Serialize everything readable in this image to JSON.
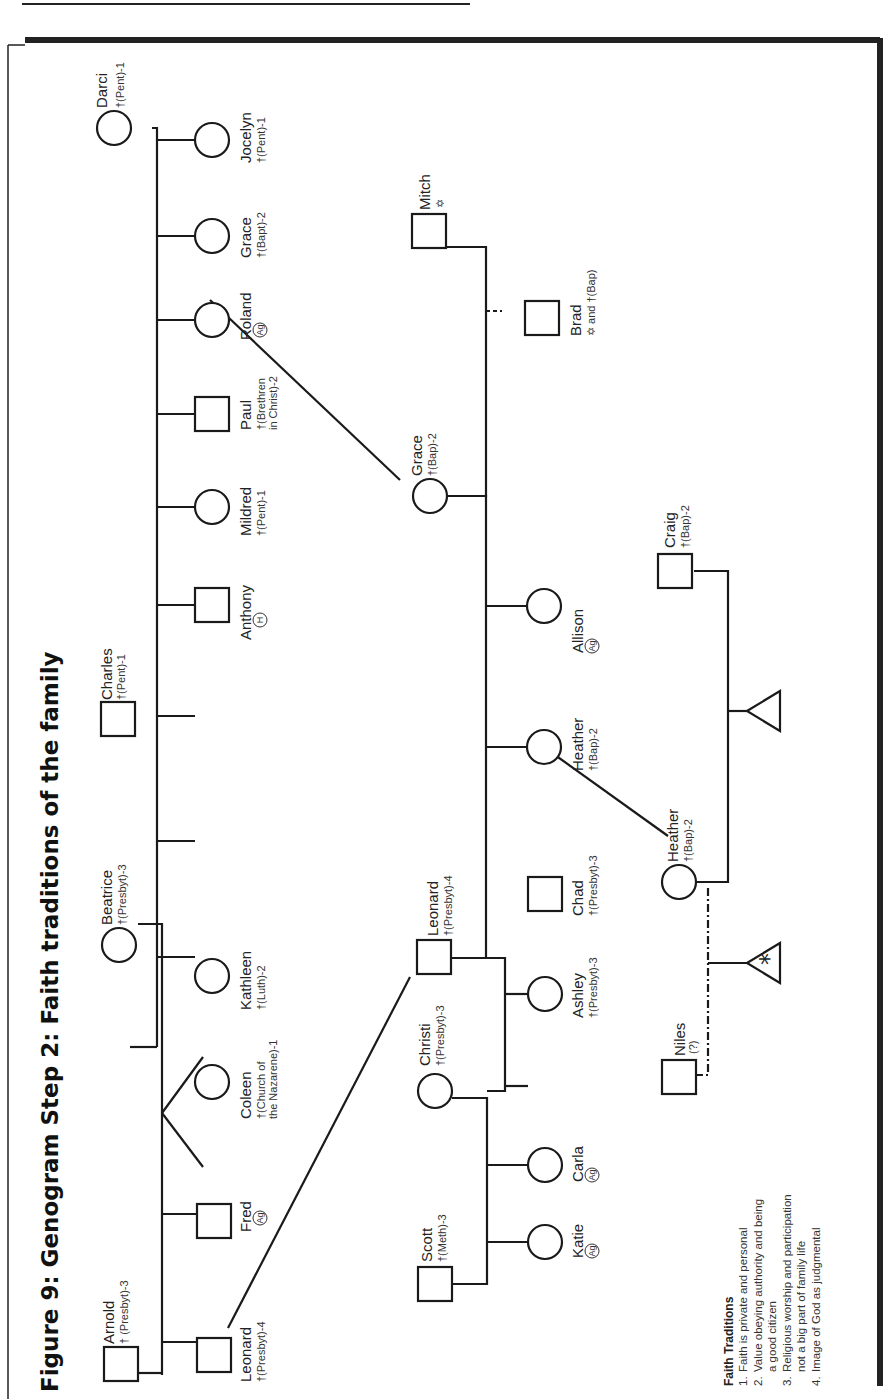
{
  "figure": {
    "title": "Figure 9: Genogram Step 2: Faith traditions of the family"
  },
  "people": {
    "darci": {
      "name": "Darci",
      "faith": "†(Pent)-1"
    },
    "jocelyn": {
      "name": "Jocelyn",
      "faith": "†(Pent)-1"
    },
    "grace_child": {
      "name": "Grace",
      "faith": "†(Bapt)-2"
    },
    "roland": {
      "name": "Roland",
      "badge": "Ag"
    },
    "paul": {
      "name": "Paul",
      "faith_line1": "†(Brethren",
      "faith_line2": "in Christ)-2"
    },
    "mildred": {
      "name": "Mildred",
      "faith": "†(Pent)-1"
    },
    "anthony": {
      "name": "Anthony",
      "badge": "H"
    },
    "charles": {
      "name": "Charles",
      "faith": "†(Pent)-1"
    },
    "beatrice": {
      "name": "Beatrice",
      "faith": "†(Presbyt)-3"
    },
    "kathleen": {
      "name": "Kathleen",
      "faith": "†(Luth)-2"
    },
    "coleen": {
      "name": "Coleen",
      "faith_line1": "†(Church of",
      "faith_line2": "the Nazarene)-1"
    },
    "fred": {
      "name": "Fred",
      "badge": "Ag"
    },
    "arnold": {
      "name": "Arnold",
      "faith": "† (Presbyt)-3"
    },
    "leonard_child": {
      "name": "Leonard",
      "faith": "†(Presbyt)-4"
    },
    "mitch": {
      "name": "Mitch",
      "symbol": "✡"
    },
    "brad": {
      "name": "Brad",
      "faith": "✡ and †(Bap)"
    },
    "grace_parent": {
      "name": "Grace",
      "faith": "†(Bap)-2"
    },
    "allison": {
      "name": "Allison",
      "badge": "Ag"
    },
    "heather_child": {
      "name": "Heather",
      "faith": "†(Bap)-2"
    },
    "leonard_parent": {
      "name": "Leonard",
      "faith": "†(Presbyt)-4"
    },
    "chad": {
      "name": "Chad",
      "faith": "†(Presbyt)-3"
    },
    "ashley": {
      "name": "Ashley",
      "faith": "†(Presbyt)-3"
    },
    "christi": {
      "name": "Christi",
      "faith": "†(Presbyt)-3"
    },
    "carla": {
      "name": "Carla",
      "badge": "Ag"
    },
    "scott": {
      "name": "Scott",
      "faith": "†(Meth)-3"
    },
    "katie": {
      "name": "Katie",
      "badge": "Ag"
    },
    "craig": {
      "name": "Craig",
      "faith": "†(Bap)-2"
    },
    "heather_parent": {
      "name": "Heather",
      "faith": "†(Bap)-2"
    },
    "niles": {
      "name": "Niles",
      "faith": "(?)"
    },
    "pregnancy_asterisk": {
      "symbol": "*"
    }
  },
  "legend": {
    "heading": "Faith Traditions",
    "items": [
      {
        "num": "1.",
        "line1": "Faith is private and personal",
        "line2": ""
      },
      {
        "num": "2.",
        "line1": "Value obeying authority and being",
        "line2": "a good citizen"
      },
      {
        "num": "3.",
        "line1": "Religious worship and participation",
        "line2": "not a big part of family life"
      },
      {
        "num": "4.",
        "line1": "Image of God as judgmental",
        "line2": ""
      }
    ]
  }
}
